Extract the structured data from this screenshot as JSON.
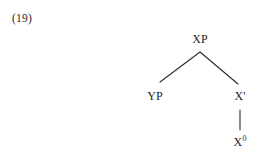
{
  "figure": {
    "example_number": "(19)",
    "background_color": "#ffffff",
    "line_color": "#2b2b2b",
    "text_color": "#1f1f1f"
  },
  "tree": {
    "nodes": [
      {
        "id": "xp",
        "label": "XP",
        "role": "maximal-projection",
        "x": 200,
        "y": 40
      },
      {
        "id": "yp",
        "label": "YP",
        "role": "specifier",
        "x": 155,
        "y": 97
      },
      {
        "id": "xbar",
        "label": "X",
        "superscript": "'",
        "role": "intermediate-projection",
        "x": 240,
        "y": 97
      },
      {
        "id": "x0",
        "label": "X",
        "superscript": "0",
        "role": "head",
        "x": 240,
        "y": 143
      }
    ],
    "edges": [
      {
        "id": "xp-yp",
        "from": "xp",
        "to": "yp",
        "x1": 200,
        "y1": 52,
        "x2": 160,
        "y2": 82
      },
      {
        "id": "xp-xbar",
        "from": "xp",
        "to": "xbar",
        "x1": 200,
        "y1": 52,
        "x2": 238,
        "y2": 84
      },
      {
        "id": "xbar-x0",
        "from": "xbar",
        "to": "x0",
        "x1": 240,
        "y1": 110,
        "x2": 240,
        "y2": 130
      }
    ]
  }
}
